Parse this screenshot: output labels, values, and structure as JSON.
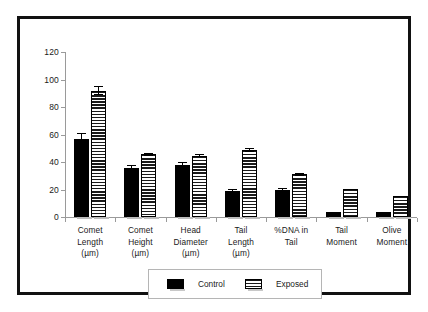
{
  "chart_data": {
    "type": "bar",
    "title": "",
    "subtitle": "",
    "xlabel": "",
    "ylabel": "",
    "ylim": [
      0,
      120
    ],
    "yticks": [
      0,
      20,
      40,
      60,
      80,
      100,
      120
    ],
    "ytick_labels": [
      "0",
      "20",
      "40",
      "60",
      "80",
      "100",
      "120"
    ],
    "grid": false,
    "legend_position": "bottom-center",
    "categories": [
      "Comet Length (µm)",
      "Comet Height (µm)",
      "Head Diameter (µm)",
      "Tail Length (µm)",
      "%DNA in Tail",
      "Tail Moment",
      "Olive Moment"
    ],
    "category_lines": [
      [
        "Comet",
        "Length",
        "(µm)"
      ],
      [
        "Comet",
        "Height",
        "(µm)"
      ],
      [
        "Head",
        "Diameter",
        "(µm)"
      ],
      [
        "Tail",
        "Length",
        "(µm)"
      ],
      [
        "%DNA in",
        "Tail"
      ],
      [
        "Tail",
        "Moment"
      ],
      [
        "Olive",
        "Moment"
      ]
    ],
    "series": [
      {
        "name": "Control",
        "color": "#000000",
        "fill": "solid",
        "values": [
          57,
          36,
          37.5,
          19,
          19.5,
          3.5,
          3.5
        ],
        "errors": [
          4,
          2,
          2.5,
          1.5,
          1.5,
          0,
          0
        ]
      },
      {
        "name": "Exposed",
        "color": "#1a1a1a",
        "fill": "horizontal-stripes",
        "values": [
          92,
          45.5,
          44.5,
          49,
          31,
          20.5,
          15
        ],
        "errors": [
          3.5,
          1,
          1,
          1.5,
          1,
          0,
          0
        ]
      }
    ]
  },
  "legend": {
    "entries": [
      {
        "label": "Control",
        "swatch": "solid-black-swatch"
      },
      {
        "label": "Exposed",
        "swatch": "striped-swatch"
      }
    ]
  }
}
